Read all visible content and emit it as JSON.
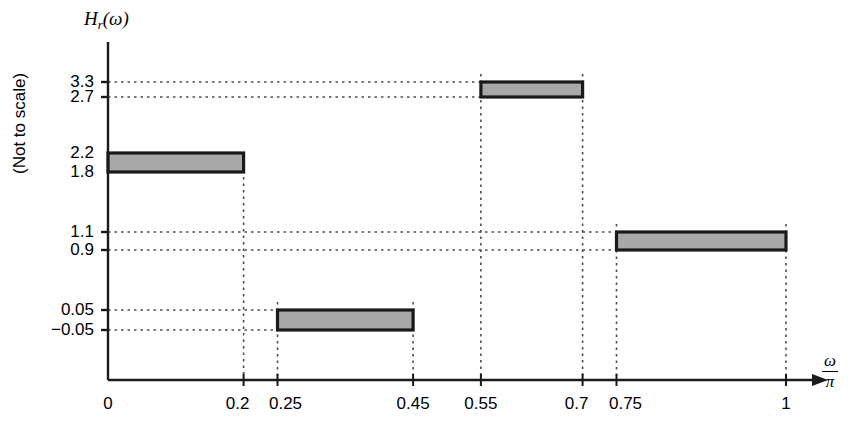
{
  "figure": {
    "y_axis_title": "H",
    "y_axis_title_sub": "r",
    "y_axis_title_arg": "(ω)",
    "y_axis_note": "(Not to scale)",
    "x_axis_numerator": "ω",
    "x_axis_denominator": "π",
    "band_fill": "#a8a8a8",
    "band_stroke": "#1a1a1a",
    "axis_color": "#1a1a1a",
    "grid_color": "#4d4d4d"
  },
  "chart_data": {
    "type": "bar",
    "xlabel": "ω/π",
    "ylabel": "H_r(ω)",
    "ylabel_note": "(Not to scale)",
    "grid": true,
    "legend": "none",
    "axis_note": "Not to scale",
    "x_ticks": [
      0,
      0.2,
      0.25,
      0.45,
      0.55,
      0.7,
      0.75,
      1
    ],
    "x_tick_labels": [
      "0",
      "0.2",
      "0.25",
      "0.45",
      "0.55",
      "0.7",
      "0.75",
      "1"
    ],
    "y_ticks": [
      -0.05,
      0.05,
      0.9,
      1.1,
      1.8,
      2.2,
      2.7,
      3.3
    ],
    "y_tick_labels": [
      "−0.05",
      "0.05",
      "0.9",
      "1.1",
      "1.8",
      "2.2",
      "2.7",
      "3.3"
    ],
    "xlim": [
      0,
      1.0
    ],
    "bands": [
      {
        "name": "band-1",
        "x_start": 0,
        "x_end": 0.2,
        "y_low": 1.8,
        "y_high": 2.2,
        "y_low_label": "1.8",
        "y_high_label": "2.2",
        "nominal": 2.0,
        "tolerance": 0.2
      },
      {
        "name": "band-2",
        "x_start": 0.25,
        "x_end": 0.45,
        "y_low": -0.05,
        "y_high": 0.05,
        "y_low_label": "−0.05",
        "y_high_label": "0.05",
        "nominal": 0.0,
        "tolerance": 0.05
      },
      {
        "name": "band-3",
        "x_start": 0.55,
        "x_end": 0.7,
        "y_low": 2.7,
        "y_high": 3.3,
        "y_low_label": "2.7",
        "y_high_label": "3.3",
        "nominal": 3.0,
        "tolerance": 0.3
      },
      {
        "name": "band-4",
        "x_start": 0.75,
        "x_end": 1.0,
        "y_low": 0.9,
        "y_high": 1.1,
        "y_low_label": "0.9",
        "y_high_label": "1.1",
        "nominal": 1.0,
        "tolerance": 0.1
      }
    ]
  }
}
